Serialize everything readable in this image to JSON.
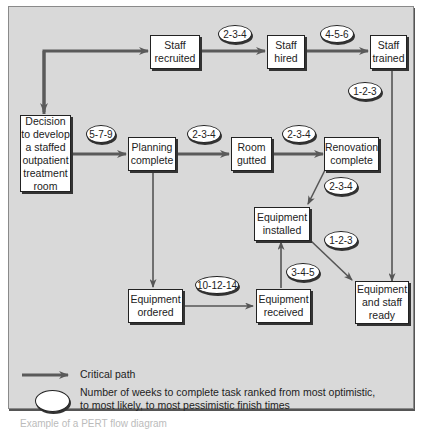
{
  "nodes": {
    "staff_recruited": [
      "Staff",
      "recruited"
    ],
    "staff_hired": [
      "Staff",
      "hired"
    ],
    "staff_trained": [
      "Staff",
      "trained"
    ],
    "decision": [
      "Decision",
      "to develop",
      "a staffed",
      "outpatient",
      "treatment",
      "room"
    ],
    "planning_complete": [
      "Planning",
      "complete"
    ],
    "room_gutted": [
      "Room",
      "gutted"
    ],
    "renovation_complete": [
      "Renovation",
      "complete"
    ],
    "equipment_installed": [
      "Equipment",
      "installed"
    ],
    "equipment_ordered": [
      "Equipment",
      "ordered"
    ],
    "equipment_received": [
      "Equipment",
      "received"
    ],
    "equipment_staff_ready": [
      "Equipment",
      "and staff",
      "ready"
    ]
  },
  "durations": {
    "recruited_to_hired": "2-3-4",
    "hired_to_trained": "4-5-6",
    "trained_to_ready": "1-2-3",
    "decision_to_planning": "5-7-9",
    "planning_to_gutted": "2-3-4",
    "gutted_to_renovation": "2-3-4",
    "renovation_to_installed": "2-3-4",
    "installed_to_ready": "1-2-3",
    "received_to_installed": "3-4-5",
    "ordered_to_received": "10-12-14"
  },
  "legend": {
    "critical_path": "Critical path",
    "oval_line1": "Number of weeks to complete task ranked from most optimistic,",
    "oval_line2": "to most likely, to most pessimistic finish times"
  },
  "caption": "Example of a PERT flow diagram",
  "colors": {
    "background": "#d9d9d9",
    "critical_arrow": "#5a5a5a",
    "thin_arrow": "#555555",
    "node_fill": "#ffffff"
  }
}
